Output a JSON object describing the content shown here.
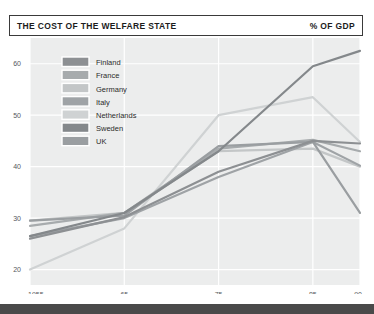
{
  "header": {
    "title": "THE COST OF THE WELFARE STATE",
    "unit": "% OF GDP"
  },
  "colors": {
    "plot_background": "#eceded",
    "gridline": "#ffffff",
    "header_border": "#3a3a3a",
    "footer_bar": "#4a4a4a",
    "axis_text": "#55595c",
    "legend_text": "#2b2b2b"
  },
  "legend": {
    "items": [
      {
        "label": "Finland",
        "color": "#8d9093"
      },
      {
        "label": "France",
        "color": "#a7abad"
      },
      {
        "label": "Germany",
        "color": "#c3c6c7"
      },
      {
        "label": "Italy",
        "color": "#9fa3a6"
      },
      {
        "label": "Netherlands",
        "color": "#cfd2d3"
      },
      {
        "label": "Sweden",
        "color": "#84888b"
      },
      {
        "label": "UK",
        "color": "#9a9ea1"
      }
    ]
  },
  "chart_data": {
    "type": "line",
    "title": "THE COST OF THE WELFARE STATE",
    "ylabel": "% of GDP",
    "xlabel": "",
    "x": [
      1955,
      1965,
      1975,
      1985,
      1990
    ],
    "xticklabels": [
      "1955",
      "65",
      "75",
      "85",
      "90"
    ],
    "yticks": [
      20,
      30,
      40,
      50,
      60
    ],
    "ylim": [
      17,
      65
    ],
    "xlim": [
      1955,
      1990
    ],
    "grid": true,
    "legend_position": "upper-left-inside",
    "series": [
      {
        "name": "Finland",
        "color": "#8d9093",
        "values": [
          26.0,
          30.2,
          39.0,
          45.0,
          44.5
        ]
      },
      {
        "name": "France",
        "color": "#a7abad",
        "values": [
          28.5,
          31.0,
          43.5,
          45.2,
          43.0
        ]
      },
      {
        "name": "Germany",
        "color": "#c3c6c7",
        "values": [
          29.5,
          31.0,
          43.0,
          43.5,
          40.0
        ]
      },
      {
        "name": "Italy",
        "color": "#9fa3a6",
        "values": [
          26.5,
          30.0,
          38.0,
          44.8,
          40.2
        ]
      },
      {
        "name": "Netherlands",
        "color": "#cfd2d3",
        "values": [
          20.0,
          28.0,
          50.0,
          53.5,
          44.8
        ]
      },
      {
        "name": "Sweden",
        "color": "#84888b",
        "values": [
          26.5,
          31.0,
          43.0,
          59.5,
          62.5
        ]
      },
      {
        "name": "UK",
        "color": "#9a9ea1",
        "values": [
          29.5,
          30.5,
          44.0,
          44.8,
          31.0
        ]
      }
    ]
  }
}
